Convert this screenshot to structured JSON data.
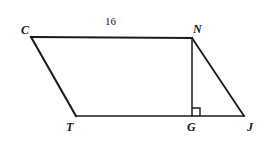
{
  "figure": {
    "kind": "geometry-diagram",
    "background_color": "#ffffff",
    "stroke_color": "#1a1a1a",
    "canvas": {
      "width": 272,
      "height": 147
    },
    "points": {
      "C": {
        "label": "C",
        "x": 31,
        "y": 37
      },
      "N": {
        "label": "N",
        "x": 192,
        "y": 38
      },
      "T": {
        "label": "T",
        "x": 76,
        "y": 116
      },
      "G": {
        "label": "G",
        "x": 192,
        "y": 116
      },
      "J": {
        "label": "J",
        "x": 244,
        "y": 116
      }
    },
    "labels": {
      "C": {
        "text": "C",
        "left": 21,
        "top": 24
      },
      "N": {
        "text": "N",
        "left": 193,
        "top": 23
      },
      "T": {
        "text": "T",
        "left": 66,
        "top": 121
      },
      "G": {
        "text": "G",
        "left": 187,
        "top": 121
      },
      "J": {
        "text": "J",
        "left": 247,
        "top": 121
      }
    },
    "measures": [
      {
        "name": "CN",
        "text": "16",
        "left": 105,
        "top": 16
      }
    ],
    "segments": [
      {
        "name": "CN",
        "from": "C",
        "to": "N",
        "width": 2.1
      },
      {
        "name": "CT",
        "from": "C",
        "to": "T",
        "width": 2.1
      },
      {
        "name": "TJ",
        "from": "T",
        "to": "J",
        "width": 1.5
      },
      {
        "name": "NG",
        "from": "N",
        "to": "G",
        "width": 1.5
      },
      {
        "name": "NJ",
        "from": "N",
        "to": "J",
        "width": 1.8
      }
    ],
    "right_angle": {
      "at": "G",
      "between": [
        "NG",
        "GJ"
      ],
      "size": 8,
      "x": 192,
      "y": 116
    }
  }
}
